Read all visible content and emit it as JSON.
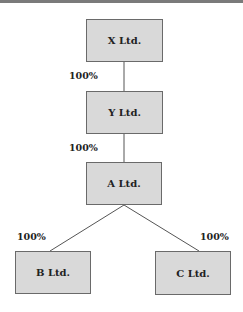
{
  "diagram": {
    "title": "",
    "nodes": [
      {
        "id": "x",
        "label": "X Ltd."
      },
      {
        "id": "y",
        "label": "Y Ltd."
      },
      {
        "id": "a",
        "label": "A Ltd."
      },
      {
        "id": "b",
        "label": "B Ltd."
      },
      {
        "id": "c",
        "label": "C Ltd."
      }
    ],
    "edges": [
      {
        "from": "x",
        "to": "y",
        "label": "100%"
      },
      {
        "from": "y",
        "to": "a",
        "label": "100%"
      },
      {
        "from": "a",
        "to": "b",
        "label": "100%"
      },
      {
        "from": "a",
        "to": "c",
        "label": "100%"
      }
    ],
    "colors": {
      "box_fill": "#d9d9d9",
      "box_border": "#6a6a6a",
      "line": "#555555"
    }
  }
}
